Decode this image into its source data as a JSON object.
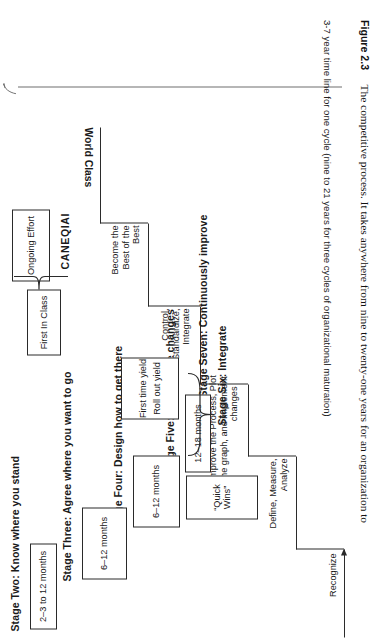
{
  "figure": {
    "number": "Figure 2.3",
    "caption": "The competitive process. It takes anywhere from nine to twenty-one years for an organization to",
    "timeline_note": "3-7 year time line for one cycle (nine to 21 years for three cycles of organizational maturation)"
  },
  "stages": [
    {
      "id": "stage-two",
      "title": "Stage Two:  Know where you stand",
      "duration": "2–3 to 12 months"
    },
    {
      "id": "stage-three",
      "title": "Stage Three:  Agree where you want to go",
      "duration": "6–12 months"
    },
    {
      "id": "stage-four",
      "title": "Stage Four:  Design how to get there",
      "duration": "6–12 months"
    },
    {
      "id": "stage-five",
      "title": "Stage Five:  Roll out the changes",
      "duration": "12–18 months"
    },
    {
      "id": "stage-six",
      "title": "Stage Six:  Integrate",
      "duration": ""
    },
    {
      "id": "stage-seven",
      "title": "Stage Seven:  Continuously improve",
      "duration": ""
    }
  ],
  "boxes": {
    "quick_wins": "“Quick Wins”",
    "first_time_yield": "First time yield",
    "roll_out_yield": "Roll out yield",
    "first_in_class": "First In Class",
    "ongoing_effort": "Ongoing Effort"
  },
  "step_labels": [
    {
      "id": "recognize",
      "text": "Recognize"
    },
    {
      "id": "define-measure-analyze",
      "line1": "Define, Measure,",
      "line2": "Analyze"
    },
    {
      "id": "improve-plot-implement",
      "line1": "Improve the Process, Plot",
      "line2": "the graph, and implement",
      "line3": "changes"
    },
    {
      "id": "control-standardize-integrate",
      "line1": "Control,",
      "line2": "Standardize,",
      "line3": "Integrate"
    },
    {
      "id": "become-best-of-best",
      "line1": "Become the",
      "line2": "Best of the",
      "line3": "Best"
    },
    {
      "id": "world-class",
      "text": "World Class"
    }
  ],
  "artifact_text": {
    "canequai": "CANEQIAI"
  },
  "colors": {
    "ink": "#1a1a1a",
    "rule": "#2b2b2b",
    "arrow": "#6f6f6f",
    "paper": "#ffffff"
  }
}
